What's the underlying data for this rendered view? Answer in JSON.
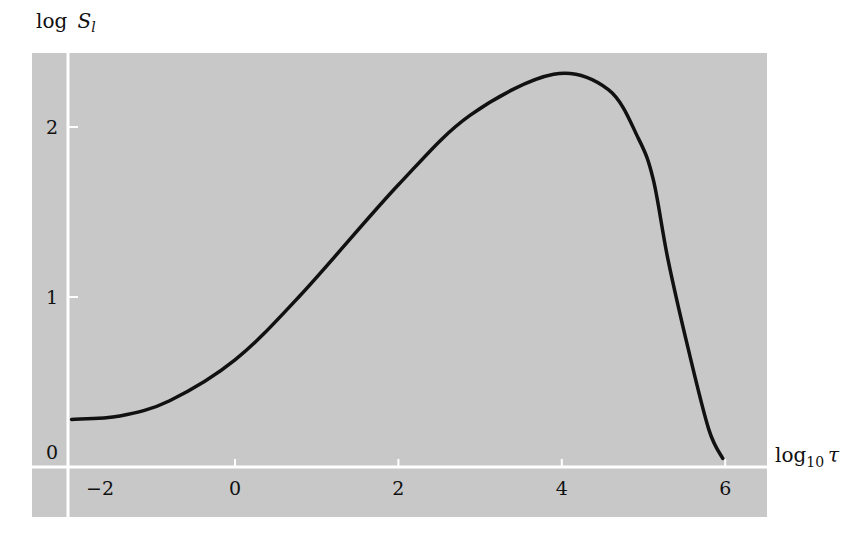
{
  "chart_data": {
    "type": "line",
    "title": "",
    "xlabel": "log10 τ",
    "ylabel": "log S_l",
    "xlim": [
      -2.1,
      6.5
    ],
    "ylim": [
      -0.3,
      2.5
    ],
    "x_ticks": [
      -2,
      0,
      2,
      4,
      6
    ],
    "y_ticks": [
      0,
      1,
      2
    ],
    "grid": false,
    "legend": null,
    "series": [
      {
        "name": "log S_l",
        "x": [
          -2.0,
          -1.41,
          -0.8,
          0.0,
          0.8,
          2.0,
          2.88,
          3.9,
          4.57,
          4.94,
          5.12,
          5.3,
          5.55,
          5.8,
          5.97
        ],
        "y": [
          0.28,
          0.3,
          0.39,
          0.63,
          1.01,
          1.66,
          2.07,
          2.31,
          2.22,
          1.93,
          1.69,
          1.22,
          0.69,
          0.22,
          0.05
        ]
      }
    ]
  },
  "axes": {
    "x_label_main": "log",
    "x_label_sub": "10",
    "x_label_var": "τ",
    "y_label_main": "log",
    "y_label_var": "S",
    "y_label_sub": "l",
    "x_tick_labels": [
      "−2",
      "0",
      "2",
      "4",
      "6"
    ],
    "y_tick_labels": [
      "0",
      "1",
      "2"
    ]
  },
  "colors": {
    "panel": "#c8c8c8",
    "axis": "#ffffff",
    "curve": "#111111"
  }
}
